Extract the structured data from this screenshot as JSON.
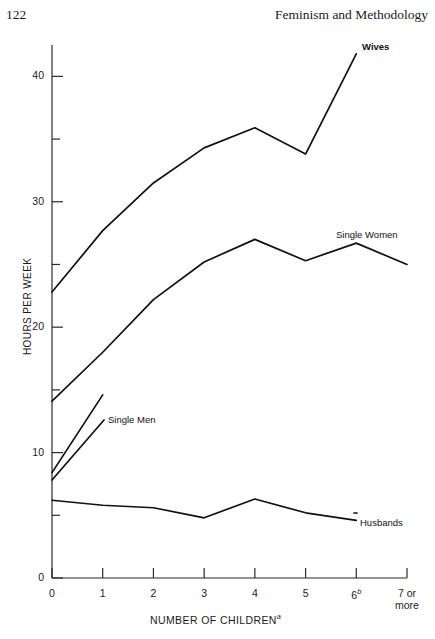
{
  "page": {
    "number": "122",
    "running_head": "Feminism and Methodology"
  },
  "chart_data": {
    "type": "line",
    "title": "",
    "xlabel": "NUMBER OF CHILDREN",
    "xlabel_superscript": "a",
    "ylabel": "HOURS PER WEEK",
    "x": [
      0,
      1,
      2,
      3,
      4,
      5,
      6,
      7
    ],
    "categories": [
      "0",
      "1",
      "2",
      "3",
      "4",
      "5",
      "6",
      "7 or more"
    ],
    "xtick_labels": [
      "0",
      "1",
      "2",
      "3",
      "4",
      "5",
      "6",
      "7 or\nmore"
    ],
    "xtick_superscripts": [
      "",
      "",
      "",
      "",
      "",
      "",
      "b",
      ""
    ],
    "ytick_labels": [
      "0",
      "10",
      "20",
      "30",
      "40"
    ],
    "ytick_values": [
      0,
      10,
      20,
      30,
      40
    ],
    "yminor_values": [
      5,
      15,
      25,
      35
    ],
    "ylim": [
      0,
      42.5
    ],
    "xlim": [
      0,
      7
    ],
    "grid": false,
    "legend_position": "inline-annotations",
    "series": [
      {
        "name": "Wives",
        "label": "Wives",
        "x": [
          0,
          1,
          2,
          3,
          4,
          5,
          6
        ],
        "values": [
          22.8,
          27.7,
          31.5,
          34.3,
          35.9,
          33.8,
          41.8
        ]
      },
      {
        "name": "Single Women",
        "label": "Single Women",
        "x": [
          0,
          1,
          2,
          3,
          4,
          5,
          6,
          7
        ],
        "values": [
          14.1,
          18.0,
          22.2,
          25.2,
          27.0,
          25.3,
          26.7,
          25.0
        ]
      },
      {
        "name": "Single Men",
        "label": "Single Men",
        "x": [
          0,
          1
        ],
        "values": [
          8.4,
          14.6
        ]
      },
      {
        "name": "Husbands",
        "label": "Husbands",
        "x": [
          0,
          1,
          2,
          3,
          4,
          5,
          6
        ],
        "values": [
          6.2,
          5.8,
          5.6,
          4.8,
          6.3,
          5.2,
          4.6
        ]
      }
    ],
    "colors": {
      "line": "#111111",
      "axis": "#2b2b2b",
      "background": "#ffffff"
    }
  }
}
